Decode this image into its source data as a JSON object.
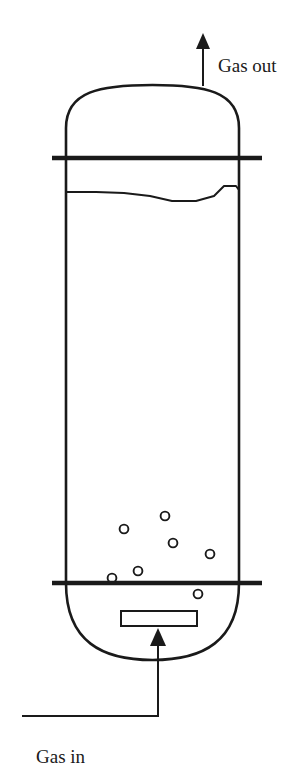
{
  "figure": {
    "kind": "process-flow-diagram",
    "background_color": "#ffffff",
    "line_color": "#1a1a1a",
    "labels": [
      {
        "id": "gas-out",
        "text": "Gas out",
        "x": 218,
        "y": 72
      },
      {
        "id": "gas-in",
        "text": "Gas in",
        "x": 36,
        "y": 763
      }
    ],
    "vessel": {
      "left_wall_x": 66,
      "right_wall_x": 239,
      "top_dome_apex_y": 85,
      "shell_top_y": 158,
      "shell_bottom_y": 583,
      "bottom_dome_base_y": 660,
      "wall_stroke_width": 2.6
    },
    "upper_tray": {
      "id": "upper-thick-line",
      "x1": 52,
      "x2": 262,
      "y": 158,
      "stroke_width": 4.5
    },
    "lower_tray": {
      "id": "lower-thick-line",
      "x1": 52,
      "x2": 262,
      "y": 583,
      "stroke_width": 4.5
    },
    "liquid_surface": {
      "id": "liquid-level-wave",
      "stroke_width": 2.0,
      "points": "66,192 96,192 124,193 150,196 172,201 196,201 214,196 224,186 236,186 239,190"
    },
    "gas_outlet": {
      "id": "gas-outlet-arrow",
      "x": 203,
      "y_tail": 86,
      "y_head": 33,
      "stroke_width": 2.0,
      "arrow_half_width": 7,
      "arrow_length": 16
    },
    "gas_inlet": {
      "id": "gas-inlet-pipe",
      "horizontal_y": 716,
      "horizontal_x_start": 22,
      "riser_x": 158,
      "y_head": 628,
      "stroke_width": 2.0,
      "arrow_half_width": 8,
      "arrow_length": 18
    },
    "sparger": {
      "id": "sparger-plate",
      "x": 121,
      "y": 611,
      "width": 76,
      "height": 15,
      "stroke_width": 2.0,
      "fill": "#ffffff"
    },
    "bubbles": [
      {
        "cx": 165,
        "cy": 516,
        "r": 4.4
      },
      {
        "cx": 124,
        "cy": 529,
        "r": 4.4
      },
      {
        "cx": 173,
        "cy": 543,
        "r": 4.4
      },
      {
        "cx": 210,
        "cy": 554,
        "r": 4.4
      },
      {
        "cx": 138,
        "cy": 571,
        "r": 4.4
      },
      {
        "cx": 112,
        "cy": 578,
        "r": 4.4
      },
      {
        "cx": 198,
        "cy": 594,
        "r": 4.4
      }
    ]
  }
}
